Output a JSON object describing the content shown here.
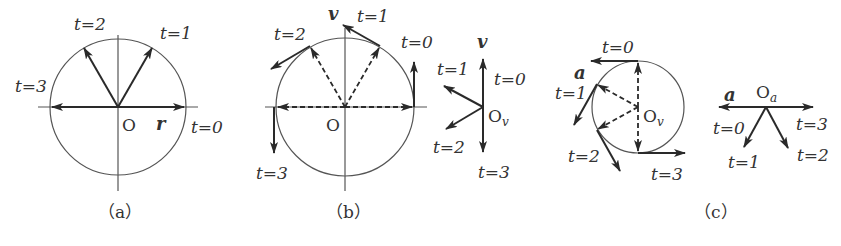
{
  "figure": {
    "colors": {
      "stroke": "#2a2a2a",
      "thin": "#555555",
      "text": "#333333",
      "background": "#ffffff"
    },
    "panels": [
      {
        "id": "a",
        "caption": "（a）",
        "vector_symbol": "r",
        "origin_label": "O",
        "description": "Position vector r rotating on a circle centered at O",
        "time_labels": [
          "t=0",
          "t=1",
          "t=2",
          "t=3"
        ]
      },
      {
        "id": "b",
        "caption": "（b）",
        "vector_symbol": "v",
        "origin_label": "O",
        "description": "Velocity vectors tangent to the circle at t=0..3, with dashed position vectors",
        "time_labels": [
          "t=0",
          "t=1",
          "t=2",
          "t=3"
        ],
        "hodograph": {
          "vector_symbol": "v",
          "origin_label": "O",
          "origin_subscript": "v",
          "time_labels": [
            "t=0",
            "t=1",
            "t=2",
            "t=3"
          ]
        }
      },
      {
        "id": "c",
        "caption": "（c）",
        "vector_symbol": "a",
        "origin_label": "O",
        "origin_subscript": "v",
        "description": "Velocity hodograph circle with acceleration vectors tangent at t=0..3",
        "time_labels": [
          "t=0",
          "t=1",
          "t=2",
          "t=3"
        ],
        "hodograph": {
          "vector_symbol": "a",
          "origin_label": "O",
          "origin_subscript": "a",
          "time_labels": [
            "t=0",
            "t=1",
            "t=2",
            "t=3"
          ]
        }
      }
    ]
  }
}
